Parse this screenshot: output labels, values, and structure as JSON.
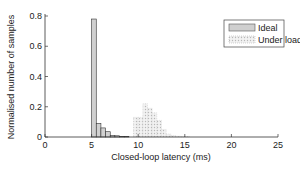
{
  "chart_data": {
    "type": "bar",
    "title": "",
    "xlabel": "Closed-loop latency (ms)",
    "ylabel": "Normalised number of samples",
    "xlim": [
      0,
      25
    ],
    "ylim": [
      0,
      0.8
    ],
    "xticks": [
      0,
      5,
      10,
      15,
      20,
      25
    ],
    "yticks": [
      0,
      0.2,
      0.4,
      0.6,
      0.8
    ],
    "ytick_labels": [
      "0",
      "0.2",
      "0.4",
      "0.6",
      "0.8"
    ],
    "bin_width": 0.5,
    "grid": false,
    "legend_position": "upper right",
    "series": [
      {
        "name": "Ideal",
        "bins": [
          5.0,
          5.5,
          6.0,
          6.5,
          7.0,
          7.5,
          8.0,
          8.5
        ],
        "values": [
          0.78,
          0.09,
          0.06,
          0.035,
          0.01,
          0.008,
          0.004,
          0.002
        ],
        "style": "solid-gray"
      },
      {
        "name": "Under load",
        "bins": [
          9.5,
          10.0,
          10.5,
          11.0,
          11.5,
          12.0,
          12.5,
          13.0,
          13.5,
          14.0,
          14.5,
          15.0
        ],
        "values": [
          0.13,
          0.13,
          0.22,
          0.19,
          0.16,
          0.11,
          0.05,
          0.02,
          0.01,
          0.005,
          0.003,
          0.003
        ],
        "style": "dotted-light"
      }
    ]
  }
}
